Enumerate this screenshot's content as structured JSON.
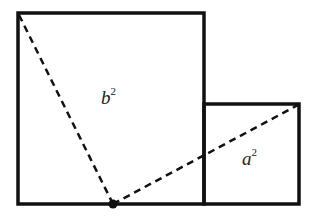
{
  "diagram": {
    "colors": {
      "stroke": "#111111",
      "background": "#ffffff",
      "text": "#222222"
    },
    "large_square": {
      "label_base": "b",
      "label_exp": "2",
      "x": 18,
      "y": 13,
      "size": 186
    },
    "small_square": {
      "label_base": "a",
      "label_exp": "2",
      "x": 204,
      "y": 104,
      "size": 95
    },
    "point": {
      "x": 113,
      "y": 204
    },
    "dashed_lines": [
      {
        "from": [
          18,
          13
        ],
        "to": [
          113,
          204
        ]
      },
      {
        "from": [
          113,
          204
        ],
        "to": [
          299,
          104
        ]
      }
    ]
  }
}
